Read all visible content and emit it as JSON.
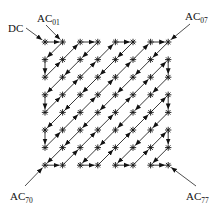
{
  "diagram": {
    "grid_size": 8,
    "origin": {
      "x": 45,
      "y": 42
    },
    "spacing": 17.6,
    "colors": {
      "stroke": "#222222",
      "node": "#111111",
      "text": "#111111"
    },
    "labels": [
      {
        "id": "dc",
        "main": "DC",
        "sub": "",
        "x": 8,
        "y": 32,
        "arrow_from": [
          26,
          28
        ],
        "arrow_to_node": [
          0,
          0
        ]
      },
      {
        "id": "ac01",
        "main": "AC",
        "sub": "01",
        "x": 37,
        "y": 22,
        "arrow_from": [
          46,
          25
        ],
        "arrow_to_node": [
          0,
          1
        ]
      },
      {
        "id": "ac07",
        "main": "AC",
        "sub": "07",
        "x": 185,
        "y": 20,
        "arrow_from": [
          190,
          24
        ],
        "arrow_to_node": [
          0,
          7
        ]
      },
      {
        "id": "ac70",
        "main": "AC",
        "sub": "70",
        "x": 10,
        "y": 200,
        "arrow_from": [
          25,
          186
        ],
        "arrow_to_node": [
          7,
          0
        ]
      },
      {
        "id": "ac77",
        "main": "AC",
        "sub": "77",
        "x": 186,
        "y": 200,
        "arrow_from": [
          196,
          186
        ],
        "arrow_to_node": [
          7,
          7
        ]
      }
    ]
  }
}
